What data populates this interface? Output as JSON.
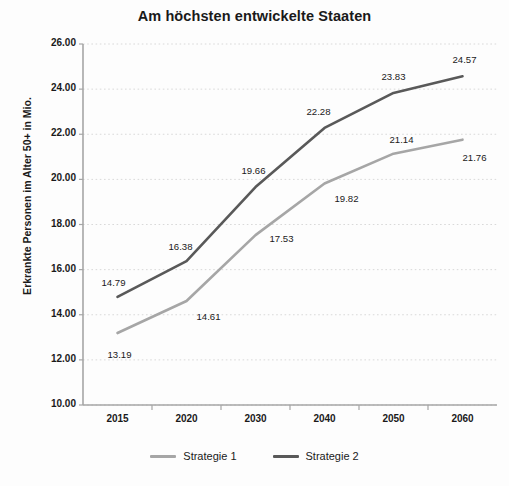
{
  "chart_data": {
    "type": "line",
    "title": "Am höchsten entwickelte Staaten",
    "xlabel": "",
    "ylabel": "Erkrankte Personen im Alter 50+ in Mio.",
    "categories": [
      "2015",
      "2020",
      "2030",
      "2040",
      "2050",
      "2060"
    ],
    "ylim": [
      10.0,
      26.0
    ],
    "ytick_step": 2.0,
    "ytick_labels": [
      "26.00",
      "24.00",
      "22.00",
      "20.00",
      "18.00",
      "16.00",
      "14.00",
      "12.00",
      "10.00"
    ],
    "grid": "horizontal-dotted",
    "legend_position": "bottom-center",
    "series": [
      {
        "name": "Strategie 1",
        "color": "#a6a6a6",
        "values": [
          13.19,
          14.61,
          17.53,
          19.82,
          21.14,
          21.76
        ],
        "labels": [
          "13.19",
          "14.61",
          "17.53",
          "19.82",
          "21.14",
          "21.76"
        ]
      },
      {
        "name": "Strategie 2",
        "color": "#595959",
        "values": [
          14.79,
          16.38,
          19.66,
          22.28,
          23.83,
          24.57
        ],
        "labels": [
          "14.79",
          "16.38",
          "19.66",
          "22.28",
          "23.83",
          "24.57"
        ]
      }
    ]
  },
  "colors": {
    "series1": "#a6a6a6",
    "series2": "#595959",
    "axis": "#a6a6a6",
    "grid": "#d9d9d9",
    "text": "#1a1a1a",
    "background": "#fdfdfd"
  }
}
